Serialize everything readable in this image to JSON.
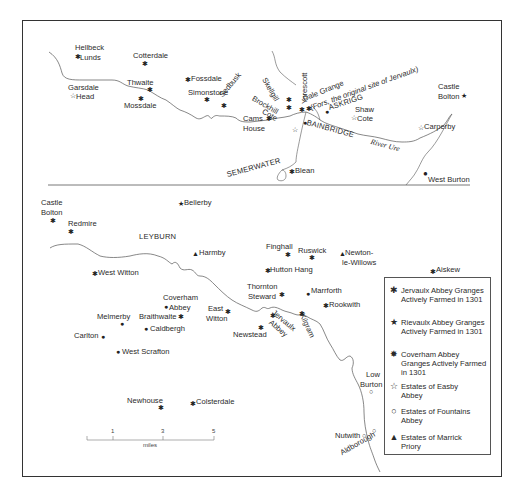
{
  "map": {
    "upper_panel": {
      "places": [
        {
          "name": "Hellbeck Lunds",
          "line1": "Hellbeck",
          "line2": "Lunds",
          "symbol": "jervaux"
        },
        {
          "name": "Cotterdale",
          "symbol": "jervaux"
        },
        {
          "name": "Garsdale Head",
          "line1": "Garsdale",
          "line2": "Head",
          "symbol": "easby"
        },
        {
          "name": "Thwaite",
          "symbol": "jervaux"
        },
        {
          "name": "Mossdale",
          "symbol": "jervaux"
        },
        {
          "name": "Fossdale",
          "symbol": "jervaux"
        },
        {
          "name": "Simonstone",
          "symbol": "jervaux"
        },
        {
          "name": "Sedbusk",
          "symbol": "jervaux"
        },
        {
          "name": "Skellgill",
          "symbol": "jervaux"
        },
        {
          "name": "Yorescott",
          "symbol": "jervaux"
        },
        {
          "name": "Brockhill Cote",
          "line1": "Brockhill",
          "line2": "Cote",
          "symbol": "jervaux"
        },
        {
          "name": "Dale Grange",
          "note": "(Fors, the original site of Jervaulx)",
          "symbol": "jervaux"
        },
        {
          "name": "ASKRIGG",
          "symbol": "coverham"
        },
        {
          "name": "Cams House",
          "line1": "Cams",
          "line2": "House",
          "symbol": "jervaux"
        },
        {
          "name": "Shaw Cote",
          "line1": "Shaw",
          "line2": "Cote",
          "symbol": "easby"
        },
        {
          "name": "BAINBRIDGE",
          "symbol": "coverham"
        },
        {
          "name": "Castle Bolton",
          "line1": "Castle",
          "line2": "Bolton",
          "symbol": "rievaulx"
        },
        {
          "name": "Carperby",
          "symbol": "easby"
        },
        {
          "name": "SEMERWATER",
          "symbol": "none"
        },
        {
          "name": "Blean",
          "symbol": "jervaux"
        },
        {
          "name": "West Burton",
          "symbol": "coverham"
        }
      ],
      "river_label": "River Ure"
    },
    "lower_panel": {
      "places": [
        {
          "name": "Castle Bolton",
          "line1": "Castle",
          "line2": "Bolton",
          "symbol": "jervaux"
        },
        {
          "name": "Redmire",
          "symbol": "jervaux"
        },
        {
          "name": "Bellerby",
          "symbol": "rievaulx"
        },
        {
          "name": "LEYBURN",
          "symbol": "none"
        },
        {
          "name": "Harmby",
          "symbol": "marrick"
        },
        {
          "name": "Finghall",
          "symbol": "jervaux"
        },
        {
          "name": "Ruswick",
          "symbol": "jervaux"
        },
        {
          "name": "Newton-le-Willows",
          "line1": "Newton-",
          "line2": "le-Willows",
          "symbol": "marrick"
        },
        {
          "name": "Aiskew",
          "symbol": "jervaux"
        },
        {
          "name": "West Witton",
          "symbol": "jervaux"
        },
        {
          "name": "Hutton Hang",
          "symbol": "jervaux"
        },
        {
          "name": "Thornton Steward",
          "line1": "Thornton",
          "line2": "Steward",
          "symbol": "jervaux"
        },
        {
          "name": "Marrforth",
          "symbol": "coverham"
        },
        {
          "name": "Rookwith",
          "symbol": "jervaux"
        },
        {
          "name": "Coverham Abbey",
          "line1": "Coverham",
          "line2": "Abbey",
          "symbol": "coverham"
        },
        {
          "name": "East Witton",
          "line1": "East",
          "line2": "Witton",
          "symbol": "jervaux"
        },
        {
          "name": "Melmerby",
          "symbol": "coverham"
        },
        {
          "name": "Braithwaite",
          "symbol": "jervaux"
        },
        {
          "name": "Caldbergh",
          "symbol": "coverham"
        },
        {
          "name": "Newstead",
          "symbol": "jervaux"
        },
        {
          "name": "Jervaulx Abbey",
          "line1": "Jervaulx",
          "line2": "Abbey",
          "symbol": "jervaux"
        },
        {
          "name": "Kilgram",
          "symbol": "jervaux"
        },
        {
          "name": "Carlton",
          "symbol": "coverham"
        },
        {
          "name": "West Scrafton",
          "symbol": "coverham"
        },
        {
          "name": "Low Burton",
          "line1": "Low",
          "line2": "Burton",
          "symbol": "fountains"
        },
        {
          "name": "Newhouse",
          "symbol": "jervaux"
        },
        {
          "name": "Colsterdale",
          "symbol": "jervaux"
        },
        {
          "name": "Nutwith",
          "symbol": "fountains"
        },
        {
          "name": "Aldborough",
          "symbol": "fountains"
        }
      ]
    },
    "scale_bar": {
      "ticks": [
        "1",
        "3",
        "5"
      ],
      "unit": "miles"
    },
    "legend": {
      "items": [
        {
          "symbol": "jervaux",
          "glyph": "✱",
          "label": "Jervaulx Abbey Granges Actively Farmed in 1301"
        },
        {
          "symbol": "rievaulx",
          "glyph": "★",
          "label": "Rievaulx Abbey Granges Actively Farmed in 1301"
        },
        {
          "symbol": "coverham",
          "glyph": "✸",
          "label": "Coverham Abbey Granges Actively Farmed in 1301"
        },
        {
          "symbol": "easby",
          "glyph": "☆",
          "label": "Estates of Easby Abbey"
        },
        {
          "symbol": "fountains",
          "glyph": "○",
          "label": "Estates of Fountains Abbey"
        },
        {
          "symbol": "marrick",
          "glyph": "▲",
          "label": "Estates of Marrick Priory"
        }
      ]
    }
  }
}
